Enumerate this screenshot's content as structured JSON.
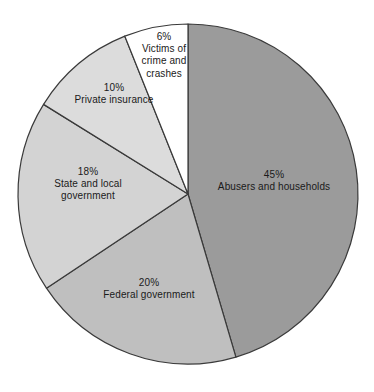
{
  "chart_data": {
    "type": "pie",
    "title": "",
    "subtitle": "",
    "xlabel": "",
    "ylabel": "",
    "legend_position": "none",
    "grid": false,
    "start_angle_deg": 0,
    "direction": "clockwise",
    "units": "percent",
    "total": 99,
    "categories": [
      "Abusers and households",
      "Federal government",
      "State and local government",
      "Private insurance",
      "Victims of crime and crashes"
    ],
    "values": [
      45,
      20,
      18,
      10,
      6
    ],
    "slices": [
      {
        "label": "Abusers and households",
        "label_lines": [
          "Abusers and households"
        ],
        "percent_text": "45%",
        "value": 45,
        "color": "#9b9b9b",
        "label_x": 274,
        "label_y": 181
      },
      {
        "label": "Federal government",
        "label_lines": [
          "Federal government"
        ],
        "percent_text": "20%",
        "value": 20,
        "color": "#bfbfbf",
        "label_x": 149,
        "label_y": 289
      },
      {
        "label": "State and local government",
        "label_lines": [
          "State and local",
          "government"
        ],
        "percent_text": "18%",
        "value": 18,
        "color": "#d3d3d3",
        "label_x": 88,
        "label_y": 184
      },
      {
        "label": "Private insurance",
        "label_lines": [
          "Private insurance"
        ],
        "percent_text": "10%",
        "value": 10,
        "color": "#dcdcdc",
        "label_x": 114,
        "label_y": 94
      },
      {
        "label": "Victims of crime and crashes",
        "label_lines": [
          "Victims of",
          "crime and",
          "crashes"
        ],
        "percent_text": "6%",
        "value": 6,
        "color": "#ffffff",
        "label_x": 164,
        "label_y": 55
      }
    ],
    "geometry": {
      "center_x": 188,
      "center_y": 194,
      "radius": 170
    },
    "stroke_color": "#3a3a3a"
  }
}
